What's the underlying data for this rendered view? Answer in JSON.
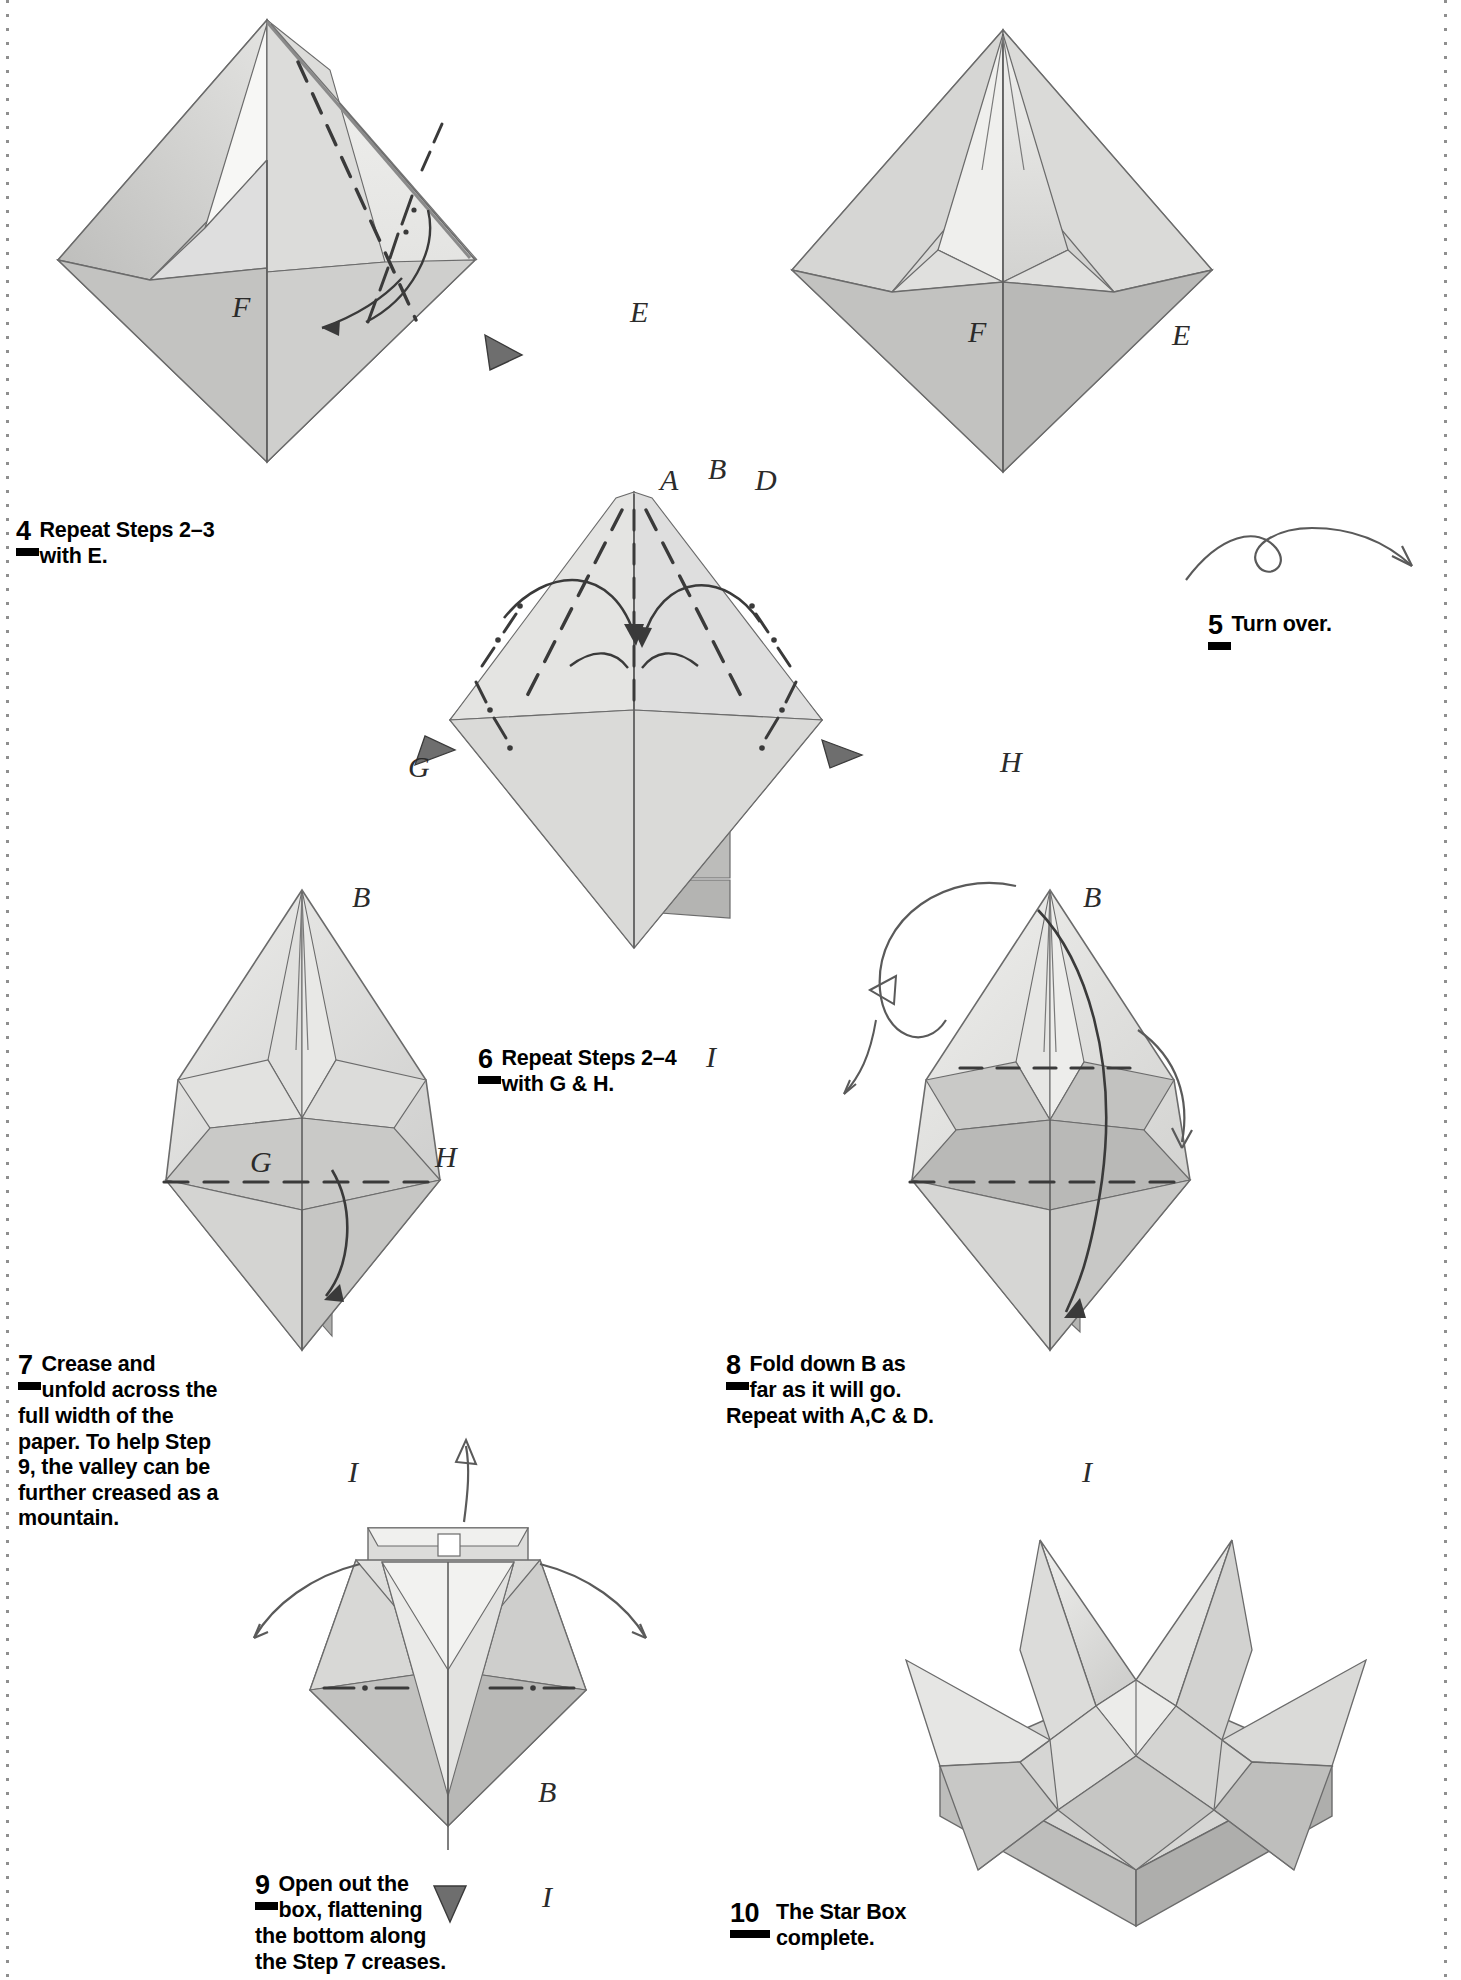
{
  "page": {
    "width": 1461,
    "height": 1980,
    "background": "#ffffff"
  },
  "steps": [
    {
      "number": "4",
      "text_lines": [
        "Repeat Steps 2–3",
        "with E."
      ],
      "text_full": "Repeat Steps 2–3 with E."
    },
    {
      "number": "5",
      "text_lines": [
        "Turn over."
      ],
      "text_full": "Turn over."
    },
    {
      "number": "6",
      "text_lines": [
        "Repeat Steps 2–4",
        "with G & H."
      ],
      "text_full": "Repeat Steps 2–4 with G & H."
    },
    {
      "number": "7",
      "text_lines": [
        "Crease and",
        "unfold across the",
        "full width of the",
        "paper. To help Step",
        "9, the valley can be",
        "further creased as a",
        "mountain."
      ],
      "text_full": "Crease and unfold across the full width of the paper. To help Step 9, the valley can be further creased as a mountain."
    },
    {
      "number": "8",
      "text_lines": [
        "Fold down B as",
        "far as it will go.",
        "Repeat with A,C & D."
      ],
      "text_full": "Fold down B as far as it will go. Repeat with A,C & D."
    },
    {
      "number": "9",
      "text_lines": [
        "Open out the",
        "box, flattening",
        "the bottom along",
        "the Step 7 creases."
      ],
      "text_full": "Open out the box, flattening the bottom along the Step 7 creases."
    },
    {
      "number": "10",
      "text_lines": [
        "The Star Box",
        "complete."
      ],
      "text_full": "The Star Box complete."
    }
  ],
  "figures": {
    "fig4": {
      "caption_step": "4",
      "point_labels": [
        "F",
        "E"
      ]
    },
    "fig5": {
      "caption_step": "5",
      "point_labels": [
        "F",
        "E"
      ]
    },
    "fig6": {
      "caption_step": "6",
      "point_labels": [
        "A",
        "B",
        "D",
        "G",
        "H",
        "I"
      ]
    },
    "fig7": {
      "caption_step": "7",
      "point_labels": [
        "B",
        "G",
        "H",
        "I"
      ]
    },
    "fig8": {
      "caption_step": "8",
      "point_labels": [
        "B",
        "I"
      ]
    },
    "fig9": {
      "caption_step": "9",
      "point_labels": [
        "B",
        "I"
      ]
    },
    "fig10": {
      "caption_step": "10",
      "point_labels": []
    }
  },
  "colors": {
    "paper_light": "#e9e9e7",
    "paper_mid": "#d3d3d1",
    "paper_dark": "#b9b9b7",
    "paper_darker": "#a6a6a4",
    "line": "#5f5f5f",
    "ink": "#000000",
    "binding_dot": "#8f8f8f"
  }
}
